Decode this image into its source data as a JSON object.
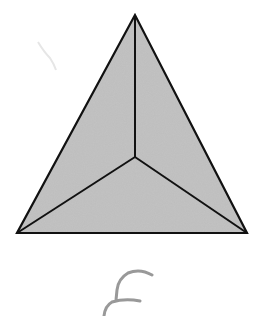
{
  "figure": {
    "fill_color": "#b9b9b9",
    "stroke_color": "#111111",
    "background": "#ffffff",
    "vertices": {
      "apex": [
        135,
        15
      ],
      "bottom_left": [
        17,
        233
      ],
      "bottom_right": [
        247,
        233
      ],
      "center": [
        135,
        157
      ]
    },
    "handwritten_mark": "f"
  }
}
